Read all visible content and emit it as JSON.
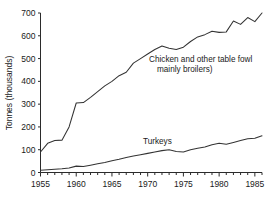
{
  "chart_data": {
    "type": "line",
    "title": "",
    "xlabel": "",
    "ylabel": "Tonnes (thousands)",
    "xlim": [
      1955,
      1986
    ],
    "ylim": [
      0,
      700
    ],
    "grid": false,
    "legend": "inline-annotations",
    "yticks": [
      0,
      100,
      200,
      300,
      400,
      500,
      600,
      700
    ],
    "ytick_labels": [
      "0",
      "100",
      "200",
      "300",
      "400",
      "500",
      "600",
      "700"
    ],
    "xticks": [
      1955,
      1960,
      1965,
      1970,
      1975,
      1980,
      1985
    ],
    "xtick_labels": [
      "1955",
      "1960",
      "1965",
      "1970",
      "1975",
      "1980",
      "1985"
    ],
    "x_minor_tick_interval": 1,
    "x": [
      1955,
      1956,
      1957,
      1958,
      1959,
      1960,
      1961,
      1962,
      1963,
      1964,
      1965,
      1966,
      1967,
      1968,
      1969,
      1970,
      1971,
      1972,
      1973,
      1974,
      1975,
      1976,
      1977,
      1978,
      1979,
      1980,
      1981,
      1982,
      1983,
      1984,
      1985,
      1986
    ],
    "series": [
      {
        "name": "Chicken and other table fowl (mainly broilers)",
        "label_line_1": "Chicken and other table fowl",
        "label_line_2": "mainly broilers)",
        "values": [
          90,
          128,
          140,
          142,
          200,
          305,
          307,
          330,
          355,
          380,
          400,
          425,
          440,
          480,
          500,
          520,
          540,
          555,
          545,
          540,
          550,
          575,
          595,
          605,
          620,
          615,
          617,
          665,
          650,
          680,
          662,
          700
        ]
      },
      {
        "name": "Turkeys",
        "label_line_1": "Turkeys",
        "values": [
          10,
          12,
          14,
          16,
          20,
          28,
          26,
          32,
          38,
          44,
          52,
          58,
          66,
          72,
          78,
          84,
          90,
          96,
          100,
          92,
          90,
          100,
          106,
          112,
          122,
          128,
          124,
          132,
          140,
          148,
          150,
          161
        ]
      }
    ],
    "annotations": [
      {
        "name": "chicken-series-label",
        "lines": [
          "Chicken and other table fowl",
          "mainly broilers)"
        ],
        "x_px": 149,
        "y_px": 62
      },
      {
        "name": "turkeys-series-label",
        "lines": [
          "Turkeys"
        ],
        "x_px": 143,
        "y_px": 144
      }
    ]
  },
  "axes": {
    "y_axis_title": "Tonnes (thousands)"
  }
}
